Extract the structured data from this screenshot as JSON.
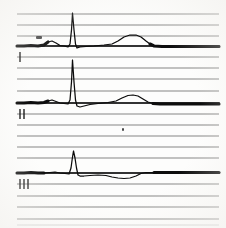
{
  "document": {
    "kind": "ecg-strip-scan",
    "background_color": "#fdfdfc",
    "grid_color": "#6d6d6d",
    "trace_color": "#0b0b0b",
    "width_px": 226,
    "height_px": 228
  },
  "grid": {
    "orientation": "horizontal",
    "line_count": 19,
    "x_start": 17,
    "x_end": 219,
    "y_positions": [
      14,
      25,
      36,
      46,
      57,
      68,
      79,
      91,
      103,
      114,
      125,
      136,
      147,
      158,
      173,
      184,
      196,
      207,
      219
    ],
    "faint_bottom_line_y": 225
  },
  "leads": [
    {
      "name": "lead-I",
      "label": "I",
      "tick_count": 1,
      "baseline_y": 46,
      "marker_y": 57,
      "marker_x": 20,
      "features": {
        "p_wave": {
          "x": 50,
          "amplitude_px": 5,
          "width_px": 20
        },
        "qrs_peak": {
          "x": 72,
          "peak_y": 13,
          "amplitude_px": 33,
          "width_px": 8
        },
        "t_wave": {
          "x": 133,
          "amplitude_px": 11,
          "width_px": 36
        }
      }
    },
    {
      "name": "lead-II",
      "label": "II",
      "tick_count": 2,
      "baseline_y": 103,
      "marker_y": 114,
      "marker_x": 20,
      "features": {
        "p_wave": {
          "x": 52,
          "amplitude_px": 3,
          "width_px": 18
        },
        "qrs_peak": {
          "x": 73,
          "peak_y": 60,
          "amplitude_px": 43,
          "width_px": 7
        },
        "t_wave": {
          "x": 133,
          "amplitude_px": 8,
          "width_px": 30
        }
      }
    },
    {
      "name": "lead-III",
      "label": "III",
      "tick_count": 3,
      "baseline_y": 173,
      "marker_y": 184,
      "marker_x": 20,
      "features": {
        "p_wave": {
          "x": 52,
          "amplitude_px": 2,
          "width_px": 16
        },
        "qrs_peak": {
          "x": 73,
          "peak_y": 151,
          "amplitude_px": 22,
          "width_px": 8
        },
        "t_wave": {
          "x": 128,
          "amplitude_px": -5,
          "width_px": 34,
          "polarity": "negative"
        }
      }
    }
  ],
  "artifacts": [
    {
      "name": "pen-smudge-lead-I",
      "x": 36,
      "y": 36,
      "w": 6,
      "h": 3
    },
    {
      "name": "speck-mid-page",
      "x": 122,
      "y": 128,
      "w": 2,
      "h": 3
    }
  ],
  "chart_data": {
    "type": "line",
    "title": "",
    "xlabel": "",
    "ylabel": "",
    "grid": true,
    "legend_position": "left-margin",
    "series": [
      {
        "name": "I",
        "baseline": 46,
        "points": "17,46 24,46 31,45.5 38,46 44,45 48,42 52,41 56,43 60,45.5 64,46 68,47 70,44 71.5,30 72.5,13 74,30 75.5,44 77,48 80,47 86,46.5 94,46 104,45 112,44 118,41 124,37 130,35 136,35 141,37 146,41 150,44 154,46 162,46.5 172,46.5 184,46.5 198,46.5 212,46.5 219,46.5"
      },
      {
        "name": "II",
        "baseline": 103,
        "points": "17,103 24,103 31,102.5 38,103 44,102.5 48,101 52,100 56,101.5 60,103 64,103.5 68,104 70,100 71.5,82 72.5,60 74,82 75.5,100 77,106 80,107 84,106 90,104.5 98,103.5 108,102.5 116,101 122,98 128,95.5 133,95 138,96 143,99 148,102 153,103.5 160,104 170,104 182,104 196,104 208,104 219,104"
      },
      {
        "name": "III",
        "baseline": 173,
        "points": "17,173 24,173 31,172.5 38,173 44,173 50,172.5 55,172 60,173 65,173.5 69,174 71,168 72.5,157 73.5,151 75,158 76.5,168 78,175 80,176 84,176 90,175.5 98,175 106,175.5 112,177 118,178 124,178.5 130,178 136,176 141,173.5 146,172.5 154,172.5 166,172.5 180,172.5 196,172.5 210,172.5 219,172.5"
      }
    ]
  }
}
